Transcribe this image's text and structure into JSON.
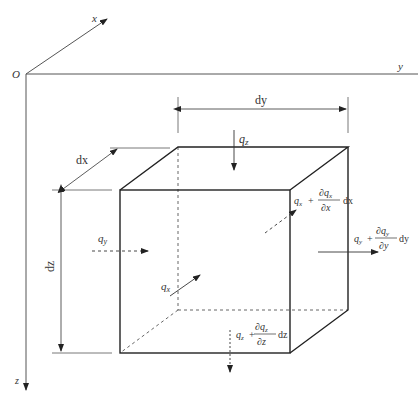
{
  "axes": {
    "origin": "O",
    "x": "x",
    "y": "y",
    "z": "z"
  },
  "dimensions": {
    "dx": "dx",
    "dy": "dy",
    "dz": "dz"
  },
  "fluxes": {
    "qz_in": "q",
    "qz_in_sub": "z",
    "qy_in": "q",
    "qy_in_sub": "y",
    "qx_in": "q",
    "qx_in_sub": "x",
    "qx_out": {
      "base": "q",
      "sub": "x",
      "plus": "+",
      "num": "∂q",
      "num_sub": "x",
      "den": "∂x",
      "tail": "dx"
    },
    "qy_out": {
      "base": "q",
      "sub": "y",
      "plus": "+",
      "num": "∂q",
      "num_sub": "y",
      "den": "∂y",
      "tail": "dy"
    },
    "qz_out": {
      "base": "q",
      "sub": "z",
      "plus": "+",
      "num": "∂q",
      "num_sub": "z",
      "den": "∂z",
      "tail": "dz"
    }
  },
  "colors": {
    "stroke": "#333333",
    "axis": "#555555"
  }
}
